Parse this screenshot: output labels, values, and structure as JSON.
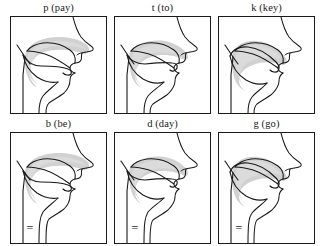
{
  "figure": {
    "layout": {
      "rows": 2,
      "cols": 3,
      "panel_width": 97,
      "panel_height": 98
    },
    "colors": {
      "outline": "#1a1a1a",
      "tongue_shading": "#c9c9c9",
      "tongue_shading_soft": "#dcdcdc",
      "background": "#ffffff",
      "border": "#1a1a1a"
    },
    "rows": [
      {
        "name": "voiceless-row",
        "voicing": "voiceless",
        "panels": [
          {
            "id": "p",
            "label": "p (pay)",
            "phoneme": "p",
            "keyword": "pay",
            "place": "bilabial",
            "manner": "stop",
            "voiced": false,
            "voicing_mark": ""
          },
          {
            "id": "t",
            "label": "t (to)",
            "phoneme": "t",
            "keyword": "to",
            "place": "alveolar",
            "manner": "stop",
            "voiced": false,
            "voicing_mark": ""
          },
          {
            "id": "k",
            "label": "k (key)",
            "phoneme": "k",
            "keyword": "key",
            "place": "velar",
            "manner": "stop",
            "voiced": false,
            "voicing_mark": ""
          }
        ]
      },
      {
        "name": "voiced-row",
        "voicing": "voiced",
        "panels": [
          {
            "id": "b",
            "label": "b (be)",
            "phoneme": "b",
            "keyword": "be",
            "place": "bilabial",
            "manner": "stop",
            "voiced": true,
            "voicing_mark": "="
          },
          {
            "id": "d",
            "label": "d (day)",
            "phoneme": "d",
            "keyword": "day",
            "place": "alveolar",
            "manner": "stop",
            "voiced": true,
            "voicing_mark": "="
          },
          {
            "id": "g",
            "label": "g (go)",
            "phoneme": "g",
            "keyword": "go",
            "place": "velar",
            "manner": "stop",
            "voiced": true,
            "voicing_mark": "="
          }
        ]
      }
    ]
  }
}
